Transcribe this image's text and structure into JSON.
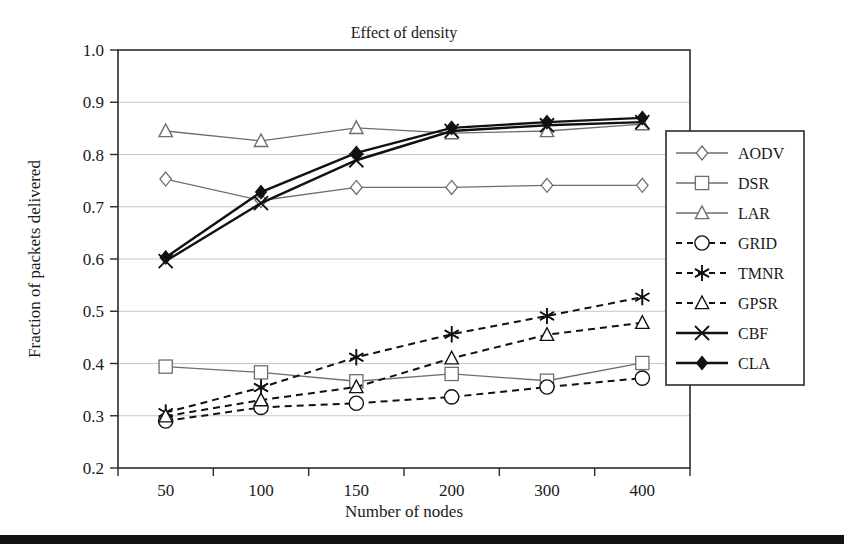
{
  "chart_data": {
    "type": "line",
    "title": "Effect of density",
    "xlabel": "Number of nodes",
    "ylabel": "Fraction of packets delivered",
    "categories": [
      "50",
      "100",
      "150",
      "200",
      "300",
      "400"
    ],
    "x_tick_labels": [
      "50",
      "100",
      "150",
      "200",
      "300",
      "400"
    ],
    "y_tick_labels": [
      "0.2",
      "0.3",
      "0.4",
      "0.5",
      "0.6",
      "0.7",
      "0.8",
      "0.9",
      "1.0"
    ],
    "ylim": [
      0.2,
      1.0
    ],
    "y_tick_step": 0.1,
    "grid": "horizontal",
    "legend_position": "right-inside",
    "series": [
      {
        "name": "AODV",
        "marker": "diamond-open",
        "linestyle": "solid",
        "color": "#6e6e6e",
        "values": [
          0.753,
          0.712,
          0.737,
          0.737,
          0.741,
          0.741
        ]
      },
      {
        "name": "DSR",
        "marker": "square-open",
        "linestyle": "solid",
        "color": "#6e6e6e",
        "values": [
          0.394,
          0.383,
          0.366,
          0.38,
          0.367,
          0.401
        ]
      },
      {
        "name": "LAR",
        "marker": "triangle-open",
        "linestyle": "solid",
        "color": "#6e6e6e",
        "values": [
          0.845,
          0.826,
          0.851,
          0.841,
          0.845,
          0.858
        ]
      },
      {
        "name": "GRID",
        "marker": "circle-open",
        "linestyle": "dashed",
        "color": "#111111",
        "values": [
          0.29,
          0.316,
          0.324,
          0.336,
          0.355,
          0.372
        ]
      },
      {
        "name": "TMNR",
        "marker": "asterisk",
        "linestyle": "dashed",
        "color": "#111111",
        "values": [
          0.306,
          0.354,
          0.412,
          0.456,
          0.491,
          0.527
        ]
      },
      {
        "name": "GPSR",
        "marker": "triangle-open",
        "linestyle": "dashed",
        "color": "#111111",
        "values": [
          0.299,
          0.33,
          0.355,
          0.41,
          0.455,
          0.478
        ]
      },
      {
        "name": "CBF",
        "marker": "x-cross",
        "linestyle": "solid",
        "color": "#111111",
        "values": [
          0.596,
          0.707,
          0.789,
          0.845,
          0.856,
          0.862
        ]
      },
      {
        "name": "CLA",
        "marker": "diamond-filled",
        "linestyle": "solid",
        "color": "#111111",
        "values": [
          0.603,
          0.728,
          0.803,
          0.851,
          0.862,
          0.87
        ]
      }
    ]
  },
  "legend": {
    "entries": [
      "AODV",
      "DSR",
      "LAR",
      "GRID",
      "TMNR",
      "GPSR",
      "CBF",
      "CLA"
    ]
  }
}
